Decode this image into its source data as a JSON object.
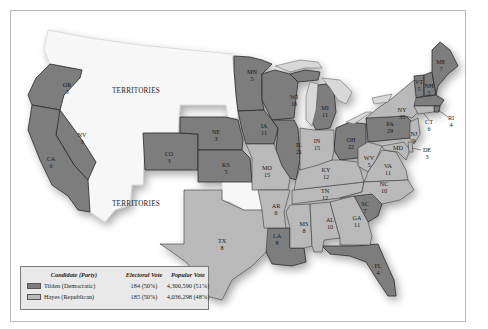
{
  "map": {
    "title": "",
    "colors": {
      "democratic": "#7d7d7d",
      "republican": "#b9b9b9",
      "territories": "#f7f7f7"
    },
    "territory_label": "TERRITORIES",
    "states": {
      "OR": {
        "abbr": "OR",
        "ev": "3",
        "shade": "dark"
      },
      "NV": {
        "abbr": "NV",
        "ev": "3",
        "shade": "dark"
      },
      "CA": {
        "abbr": "CA",
        "ev": "6",
        "shade": "dark"
      },
      "CO": {
        "abbr": "CO",
        "ev": "3",
        "shade": "dark"
      },
      "NE": {
        "abbr": "NE",
        "ev": "3",
        "shade": "dark"
      },
      "KS": {
        "abbr": "KS",
        "ev": "5",
        "shade": "dark"
      },
      "MN": {
        "abbr": "MN",
        "ev": "5",
        "shade": "dark"
      },
      "IA": {
        "abbr": "IA",
        "ev": "11",
        "shade": "dark"
      },
      "WI": {
        "abbr": "WI",
        "ev": "10",
        "shade": "dark"
      },
      "IL": {
        "abbr": "IL",
        "ev": "21",
        "shade": "dark"
      },
      "MI": {
        "abbr": "MI",
        "ev": "11",
        "shade": "dark"
      },
      "OH": {
        "abbr": "OH",
        "ev": "22",
        "shade": "dark"
      },
      "PA": {
        "abbr": "PA",
        "ev": "29",
        "shade": "dark"
      },
      "VT": {
        "abbr": "VT",
        "ev": "5",
        "shade": "dark"
      },
      "NH": {
        "abbr": "NH",
        "ev": "5",
        "shade": "dark"
      },
      "ME": {
        "abbr": "ME",
        "ev": "7",
        "shade": "dark"
      },
      "MA": {
        "abbr": "MA",
        "ev": "",
        "shade": "dark"
      },
      "RI": {
        "abbr": "RI",
        "ev": "4",
        "shade": "dark"
      },
      "LA": {
        "abbr": "LA",
        "ev": "8",
        "shade": "dark"
      },
      "SC": {
        "abbr": "SC",
        "ev": "7",
        "shade": "dark"
      },
      "FL": {
        "abbr": "FL",
        "ev": "4",
        "shade": "dark"
      },
      "TX": {
        "abbr": "TX",
        "ev": "8",
        "shade": "light"
      },
      "MO": {
        "abbr": "MO",
        "ev": "15",
        "shade": "light"
      },
      "AR": {
        "abbr": "AR",
        "ev": "6",
        "shade": "light"
      },
      "MS": {
        "abbr": "MS",
        "ev": "8",
        "shade": "light"
      },
      "AL": {
        "abbr": "AL",
        "ev": "10",
        "shade": "light"
      },
      "GA": {
        "abbr": "GA",
        "ev": "11",
        "shade": "light"
      },
      "TN": {
        "abbr": "TN",
        "ev": "12",
        "shade": "light"
      },
      "KY": {
        "abbr": "KY",
        "ev": "12",
        "shade": "light"
      },
      "IN": {
        "abbr": "IN",
        "ev": "15",
        "shade": "light"
      },
      "WV": {
        "abbr": "WV",
        "ev": "5",
        "shade": "light"
      },
      "VA": {
        "abbr": "VA",
        "ev": "11",
        "shade": "light"
      },
      "NC": {
        "abbr": "NC",
        "ev": "10",
        "shade": "light"
      },
      "NY": {
        "abbr": "NY",
        "ev": "35",
        "shade": "light"
      },
      "NJ": {
        "abbr": "NJ",
        "ev": "9",
        "shade": "light"
      },
      "CT": {
        "abbr": "CT",
        "ev": "6",
        "shade": "light"
      },
      "DE": {
        "abbr": "DE",
        "ev": "3",
        "shade": "light"
      },
      "MD": {
        "abbr": "MD",
        "ev": "8",
        "shade": "light"
      }
    }
  },
  "legend": {
    "headers": {
      "candidate": "Candidate (Party)",
      "electoral": "Electoral Vote",
      "popular": "Popular Vote"
    },
    "rows": [
      {
        "candidate": "Tilden (Democratic)",
        "electoral": "184 (50%)",
        "popular": "4,300,590 (51%)",
        "swatch": "dark"
      },
      {
        "candidate": "Hayes (Republican)",
        "electoral": "185 (50%)",
        "popular": "4,036,298 (48%)",
        "swatch": "light"
      }
    ]
  }
}
